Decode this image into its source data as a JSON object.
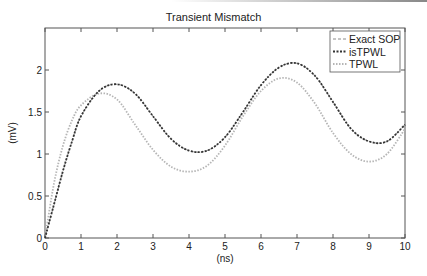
{
  "chart_data": {
    "type": "line",
    "title": "Transient Mismatch",
    "xlabel": "(ns)",
    "ylabel": "(mV)",
    "xlim": [
      0,
      10
    ],
    "ylim": [
      0,
      2.5
    ],
    "xticks": [
      0,
      1,
      2,
      3,
      4,
      5,
      6,
      7,
      8,
      9,
      10
    ],
    "yticks": [
      0,
      0.5,
      1,
      1.5,
      2
    ],
    "ytick_labels": [
      "0",
      "0.5",
      "1",
      "1.5",
      "2"
    ],
    "grid": false,
    "legend_position": "upper right",
    "x": [
      0,
      0.25,
      0.5,
      0.75,
      1,
      1.5,
      2,
      2.5,
      3,
      3.5,
      4,
      4.5,
      5,
      5.5,
      6,
      6.5,
      7,
      7.5,
      8,
      8.5,
      9,
      9.5,
      10
    ],
    "series": [
      {
        "name": "Exact SOP",
        "style": "dashed",
        "color": "#8a8a8a",
        "values": [
          0,
          0.4,
          0.8,
          1.15,
          1.45,
          1.75,
          1.83,
          1.72,
          1.45,
          1.18,
          1.04,
          1.04,
          1.2,
          1.5,
          1.82,
          2.03,
          2.08,
          1.93,
          1.62,
          1.3,
          1.15,
          1.15,
          1.35
        ]
      },
      {
        "name": "isTPWL",
        "style": "dash-dot",
        "color": "#333333",
        "values": [
          0,
          0.4,
          0.8,
          1.15,
          1.45,
          1.75,
          1.83,
          1.72,
          1.45,
          1.18,
          1.04,
          1.04,
          1.2,
          1.5,
          1.82,
          2.03,
          2.08,
          1.93,
          1.62,
          1.3,
          1.15,
          1.15,
          1.35
        ]
      },
      {
        "name": "TPWL",
        "style": "dotted",
        "color": "#b5b5b5",
        "values": [
          0,
          0.65,
          1.1,
          1.4,
          1.58,
          1.72,
          1.65,
          1.35,
          1.05,
          0.85,
          0.79,
          0.86,
          1.1,
          1.45,
          1.75,
          1.9,
          1.85,
          1.6,
          1.25,
          1.0,
          0.91,
          1.0,
          1.3
        ]
      }
    ]
  }
}
